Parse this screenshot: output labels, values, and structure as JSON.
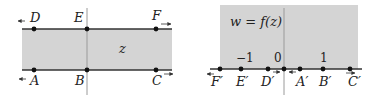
{
  "colors": {
    "shade": "#d4d4d4",
    "line": "#333333",
    "axis": "#9a9a9a",
    "point": "#111111",
    "background": "#ffffff"
  },
  "z_plane": {
    "label": "z",
    "top_points": [
      {
        "name": "D",
        "x": 34
      },
      {
        "name": "E",
        "x": 87
      },
      {
        "name": "F",
        "x": 156
      }
    ],
    "bottom_points": [
      {
        "name": "A",
        "x": 34
      },
      {
        "name": "B",
        "x": 87
      },
      {
        "name": "C",
        "x": 156
      }
    ],
    "arrows": [
      "left at D",
      "right at F",
      "left at A",
      "right at C"
    ]
  },
  "w_plane": {
    "label": "w = f(z)",
    "ticks": [
      {
        "label": "−1",
        "x": 241
      },
      {
        "label": "0",
        "x": 284
      },
      {
        "label": "1",
        "x": 323
      }
    ],
    "points": [
      {
        "name": "F′",
        "x": 220
      },
      {
        "name": "E′",
        "x": 241
      },
      {
        "name": "D′",
        "x": 268
      },
      {
        "name": "A′",
        "x": 300
      },
      {
        "name": "B′",
        "x": 323
      },
      {
        "name": "C′",
        "x": 350
      }
    ],
    "arrows": [
      "left at F′",
      "right toward 0 from D′",
      "left toward 0 from A′",
      "right at C′"
    ]
  }
}
